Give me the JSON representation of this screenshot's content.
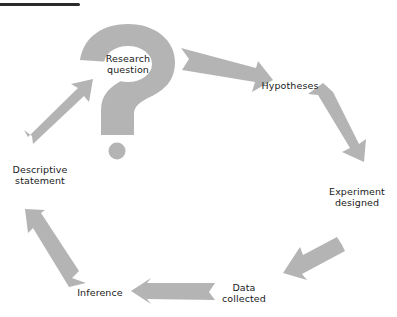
{
  "diagram": {
    "type": "cycle",
    "colors": {
      "arrow": "#b4b4b4",
      "text": "#1a1a1a",
      "rule": "#2a2a2a",
      "background": "#ffffff"
    },
    "center_icon": "question-mark-icon",
    "nodes": [
      {
        "id": "research-question",
        "label_line1": "Research",
        "label_line2": "question"
      },
      {
        "id": "hypotheses",
        "label_line1": "Hypotheses",
        "label_line2": ""
      },
      {
        "id": "experiment-designed",
        "label_line1": "Experiment",
        "label_line2": "designed"
      },
      {
        "id": "data-collected",
        "label_line1": "Data",
        "label_line2": "collected"
      },
      {
        "id": "inference",
        "label_line1": "Inference",
        "label_line2": ""
      },
      {
        "id": "descriptive-statement",
        "label_line1": "Descriptive",
        "label_line2": "statement"
      }
    ],
    "edges": [
      {
        "from": "research-question",
        "to": "hypotheses"
      },
      {
        "from": "hypotheses",
        "to": "experiment-designed"
      },
      {
        "from": "experiment-designed",
        "to": "data-collected"
      },
      {
        "from": "data-collected",
        "to": "inference"
      },
      {
        "from": "inference",
        "to": "descriptive-statement"
      },
      {
        "from": "descriptive-statement",
        "to": "research-question"
      }
    ]
  }
}
